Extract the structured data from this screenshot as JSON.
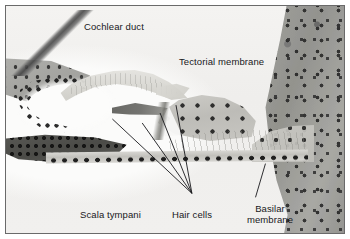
{
  "figure": {
    "type": "histology-micrograph",
    "frame_color": "#6a6a6a",
    "background_color": "#f2f1ee",
    "label_color": "#18181b",
    "leader_color": "#17171a"
  },
  "labels": [
    {
      "id": "cochlear-duct",
      "text": "Cochlear duct",
      "lines": [
        "Cochlear duct"
      ],
      "has_leader": false
    },
    {
      "id": "tectorial-membrane",
      "text": "Tectorial membrane",
      "lines": [
        "Tectorial membrane"
      ],
      "has_leader": true
    },
    {
      "id": "scala-tympani",
      "text": "Scala tympani",
      "lines": [
        "Scala tympani"
      ],
      "has_leader": false
    },
    {
      "id": "hair-cells",
      "text": "Hair cells",
      "lines": [
        "Hair cells"
      ],
      "has_leader": true
    },
    {
      "id": "basilar-membrane",
      "text": "Basilar membrane",
      "lines": [
        "Basilar",
        "membrane"
      ],
      "has_leader": true
    }
  ],
  "label_text": {
    "cochlear_duct": "Cochlear duct",
    "tectorial_membrane": "Tectorial membrane",
    "scala_tympani": "Scala tympani",
    "hair_cells": "Hair cells",
    "basilar_line1": "Basilar",
    "basilar_line2": "membrane"
  },
  "leaders": {
    "tectorial": {
      "from": [
        114,
        80
      ],
      "bend": [
        166,
        57
      ],
      "to": [
        178,
        57
      ]
    },
    "hair_cells": {
      "converge": [
        192,
        193
      ],
      "targets": [
        [
          112,
          118
        ],
        [
          142,
          122
        ],
        [
          160,
          112
        ],
        [
          176,
          104
        ]
      ]
    },
    "basilar": {
      "from": [
        266,
        163
      ],
      "to": [
        256,
        197
      ]
    }
  },
  "structures": [
    {
      "name": "reissners-membrane",
      "region": "upper-left diagonal strand"
    },
    {
      "name": "stria-vascularis",
      "region": "left wall with nuclei arc"
    },
    {
      "name": "tectorial-membrane",
      "region": "pale flame-shaped sheet, upper centre-left"
    },
    {
      "name": "organ-of-corti",
      "region": "centre, above basilar membrane"
    },
    {
      "name": "tunnel-of-corti",
      "region": "pale triangle within organ of Corti"
    },
    {
      "name": "basilar-membrane",
      "region": "thin horizontal band with dark nuclei"
    },
    {
      "name": "spiral-limbus",
      "region": "dark band lower-left"
    },
    {
      "name": "modiolar-bone",
      "region": "dense cellular mass right edge"
    }
  ]
}
